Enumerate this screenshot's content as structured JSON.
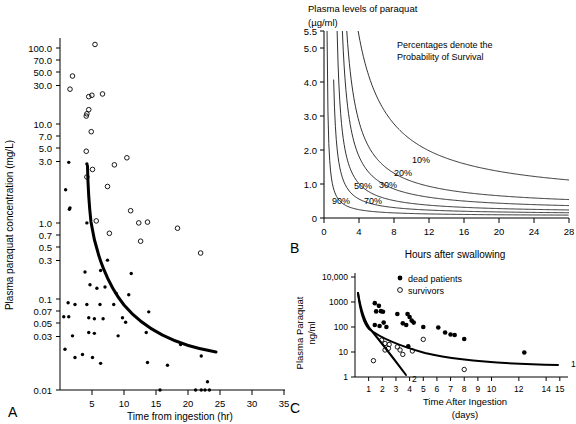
{
  "figure": {
    "panels": [
      "A",
      "B",
      "C"
    ]
  },
  "panelA": {
    "letter": "A",
    "ylabel": "Plasma paraquat concentration (mg/L)",
    "xlabel": "Time from ingestion (hr)",
    "chart_data": {
      "type": "scatter",
      "title": "",
      "xlabel": "Time from ingestion (hr)",
      "ylabel": "Plasma paraquat concentration (mg/L)",
      "yscale": "log",
      "xlim": [
        0,
        36
      ],
      "ylim": [
        0.01,
        130
      ],
      "xticks": [
        5,
        10,
        15,
        20,
        25,
        30,
        35
      ],
      "yticks": [
        100.0,
        70.0,
        50.0,
        30.0,
        10.0,
        7.0,
        5.0,
        3.0,
        1.0,
        0.7,
        0.5,
        0.3,
        0.1,
        0.07,
        0.05,
        0.03,
        0.01
      ],
      "ytick_labels": [
        "100.0",
        "70.0",
        "50.0",
        "30.0",
        "10.0",
        "7.0",
        "5.0",
        "3.0",
        "1.0",
        "0.7",
        "0.5",
        "0.3",
        "0.1",
        "0.07",
        "0.05",
        "0.03",
        "0.01"
      ],
      "grid": false,
      "series": [
        {
          "name": "survivors",
          "marker": "open-circle",
          "points": [
            [
              5.6,
              110
            ],
            [
              2.0,
              47
            ],
            [
              1.6,
              33
            ],
            [
              4.6,
              27
            ],
            [
              5.1,
              28
            ],
            [
              6.8,
              29
            ],
            [
              4.3,
              17
            ],
            [
              4.6,
              19
            ],
            [
              4.2,
              16
            ],
            [
              5.0,
              10.5
            ],
            [
              4.2,
              6.2
            ],
            [
              4.3,
              3.1
            ],
            [
              5.2,
              3.8
            ],
            [
              8.7,
              4.3
            ],
            [
              10.7,
              5.2
            ],
            [
              7.6,
              2.4
            ],
            [
              5.8,
              0.95
            ],
            [
              11.3,
              1.25
            ],
            [
              12.6,
              0.9
            ],
            [
              14.0,
              0.92
            ],
            [
              7.9,
              0.68
            ],
            [
              12.9,
              0.55
            ],
            [
              18.8,
              0.78
            ],
            [
              22.5,
              0.4
            ]
          ]
        },
        {
          "name": "dead patients",
          "marker": "filled-circle",
          "points": [
            [
              1.4,
              4.6
            ],
            [
              4.3,
              4.4
            ],
            [
              0.9,
              2.2
            ],
            [
              1.5,
              1.3
            ],
            [
              1.6,
              1.35
            ],
            [
              4.3,
              0.9
            ],
            [
              7.6,
              0.33
            ],
            [
              4.0,
              0.24
            ],
            [
              6.5,
              0.25
            ],
            [
              11.4,
              0.23
            ],
            [
              4.8,
              0.17
            ],
            [
              5.9,
              0.155
            ],
            [
              7.2,
              0.16
            ],
            [
              9.0,
              0.135
            ],
            [
              11.0,
              0.13
            ],
            [
              1.3,
              0.105
            ],
            [
              2.4,
              0.1
            ],
            [
              4.3,
              0.1
            ],
            [
              6.4,
              0.1
            ],
            [
              8.6,
              0.1
            ],
            [
              0.6,
              0.072
            ],
            [
              1.4,
              0.072
            ],
            [
              4.6,
              0.07
            ],
            [
              5.5,
              0.068
            ],
            [
              6.9,
              0.068
            ],
            [
              10.0,
              0.07
            ],
            [
              10.5,
              0.062
            ],
            [
              14.2,
              0.082
            ],
            [
              2.0,
              0.043
            ],
            [
              4.6,
              0.047
            ],
            [
              5.5,
              0.046
            ],
            [
              9.3,
              0.043
            ],
            [
              13.8,
              0.047
            ],
            [
              0.8,
              0.03
            ],
            [
              19.3,
              0.034
            ],
            [
              2.4,
              0.024
            ],
            [
              3.6,
              0.026
            ],
            [
              5.2,
              0.024
            ],
            [
              22.6,
              0.025
            ],
            [
              6.5,
              0.0205
            ],
            [
              14.0,
              0.021
            ],
            [
              17.2,
              0.0195
            ],
            [
              23.6,
              0.0125
            ],
            [
              16.0,
              0.01
            ],
            [
              21.7,
              0.01
            ],
            [
              22.6,
              0.01
            ],
            [
              23.2,
              0.01
            ],
            [
              23.9,
              0.01
            ]
          ]
        }
      ],
      "annotations": [
        {
          "name": "prognostic-curve",
          "label": "",
          "description": "Decreasing thick prognostic line from (4.3, 2.2) to (24.5, 0.095)"
        }
      ]
    }
  },
  "panelB": {
    "letter": "B",
    "header_line1": "Plasma levels of paraquat",
    "header_line2": "(µg/ml)",
    "note_line1": "Percentages denote the",
    "note_line2": "Probability of Survival",
    "xlabel": "Hours after swallowing",
    "chart_data": {
      "type": "line",
      "title": "Plasma levels of paraquat (µg/ml)",
      "xlabel": "Hours after swallowing",
      "ylabel": "Plasma levels of paraquat (µg/ml)",
      "xlim": [
        0,
        28
      ],
      "ylim": [
        0,
        5.5
      ],
      "xticks": [
        0,
        4,
        8,
        12,
        16,
        20,
        24,
        28
      ],
      "yticks": [
        0,
        1.0,
        2.0,
        3.0,
        4.0,
        5.0,
        5.5
      ],
      "ytick_labels": [
        "0",
        "1.0",
        "2.0",
        "3.0",
        "4.0",
        "5.0",
        "5.5"
      ],
      "grid": false,
      "legend": "inline curve labels",
      "series": [
        {
          "name": "90%",
          "label": "90%",
          "x0": 0.35,
          "k": 0.7,
          "offset": 0.06
        },
        {
          "name": "70%",
          "label": "70%",
          "x0": 1.0,
          "k": 1.5,
          "offset": 0.1
        },
        {
          "name": "50%",
          "label": "50%",
          "x0": 1.5,
          "k": 2.6,
          "offset": 0.14
        },
        {
          "name": "30%",
          "label": "30%",
          "x0": 2.1,
          "k": 4.4,
          "offset": 0.2
        },
        {
          "name": "20%",
          "label": "20%",
          "x0": 2.6,
          "k": 7.0,
          "offset": 0.28
        },
        {
          "name": "10%",
          "label": "10%",
          "x0": 3.9,
          "k": 17.0,
          "offset": 0.5
        }
      ],
      "curve_labels": [
        "90%",
        "70%",
        "50%",
        "30%",
        "20%",
        "10%"
      ]
    }
  },
  "panelC": {
    "letter": "C",
    "ylabel_line1": "Plasma Paraquat",
    "ylabel_line2": "ng/ml",
    "xlabel_line1": "Time After Ingestion",
    "xlabel_line2": "(days)",
    "legend": [
      {
        "marker": "filled-circle",
        "label": "dead patients"
      },
      {
        "marker": "open-circle",
        "label": "survivors"
      }
    ],
    "chart_data": {
      "type": "scatter",
      "title": "",
      "xlabel": "Time After Ingestion (days)",
      "ylabel": "Plasma Paraquat ng/ml",
      "yscale": "log",
      "xlim": [
        0,
        15.6
      ],
      "ylim": [
        1,
        10000
      ],
      "xticks": [
        1,
        2,
        3,
        4,
        5,
        6,
        7,
        8,
        9,
        10,
        12,
        14,
        15
      ],
      "xtick_labels": [
        "1",
        "2",
        "3",
        "4",
        "5",
        "6",
        "7",
        "8",
        "9",
        "10",
        "12",
        "14",
        "15"
      ],
      "yticks": [
        1,
        10,
        100,
        1000,
        10000
      ],
      "ytick_labels": [
        "1",
        "10",
        "100",
        "1000",
        "10,000"
      ],
      "grid": false,
      "series": [
        {
          "name": "dead patients",
          "marker": "filled-circle",
          "points": [
            [
              1.45,
              900
            ],
            [
              1.75,
              700
            ],
            [
              1.55,
              420
            ],
            [
              1.9,
              430
            ],
            [
              2.05,
              410
            ],
            [
              3.1,
              330
            ],
            [
              3.85,
              330
            ],
            [
              4.0,
              250
            ],
            [
              4.15,
              180
            ],
            [
              4.3,
              150
            ],
            [
              1.45,
              120
            ],
            [
              1.8,
              110
            ],
            [
              2.1,
              150
            ],
            [
              2.3,
              100
            ],
            [
              3.5,
              140
            ],
            [
              3.75,
              120
            ],
            [
              5.0,
              100
            ],
            [
              6.1,
              95
            ],
            [
              6.6,
              60
            ],
            [
              7.0,
              50
            ],
            [
              7.3,
              48
            ],
            [
              8.0,
              33
            ],
            [
              3.9,
              17
            ],
            [
              12.4,
              9.5
            ]
          ]
        },
        {
          "name": "survivors",
          "marker": "open-circle",
          "points": [
            [
              1.95,
              30
            ],
            [
              2.2,
              22
            ],
            [
              2.5,
              20
            ],
            [
              2.45,
              14
            ],
            [
              2.2,
              12
            ],
            [
              3.1,
              16
            ],
            [
              3.3,
              12
            ],
            [
              3.5,
              8
            ],
            [
              4.2,
              11
            ],
            [
              5.0,
              32
            ],
            [
              1.35,
              4.5
            ],
            [
              8.0,
              2
            ]
          ]
        }
      ],
      "annotations": [
        {
          "name": "curve-1-label",
          "label": "1",
          "description": "Slow elimination curve reaching ~4.5 ng/ml at day 15"
        },
        {
          "name": "curve-2-label",
          "label": "2",
          "description": "Fast elimination curve reaching ~1 ng/ml at day 3.2"
        }
      ]
    }
  }
}
